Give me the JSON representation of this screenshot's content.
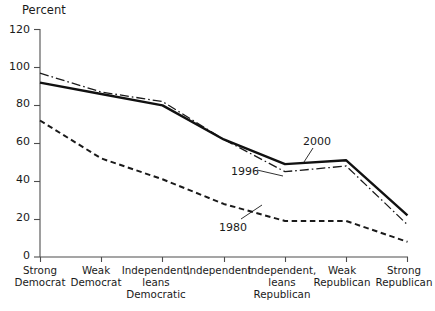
{
  "chart_data": {
    "type": "line",
    "title": "",
    "ylabel": "Percent",
    "xlabel": "",
    "ylim": [
      0,
      120
    ],
    "yticks": [
      0,
      20,
      40,
      60,
      80,
      100,
      120
    ],
    "grid": false,
    "legend_position": "inline-annotations",
    "categories": [
      "Strong\nDemocrat",
      "Weak\nDemocrat",
      "Independent,\nleans\nDemocratic",
      "Independent",
      "Independent,\nleans\nRepublican",
      "Weak\nRepublican",
      "Strong\nRepublican"
    ],
    "series": [
      {
        "name": "1996",
        "style": "dash-dot",
        "color": "#1a1a1a",
        "values": [
          97,
          87,
          82,
          62,
          45,
          48,
          17
        ]
      },
      {
        "name": "2000",
        "style": "solid",
        "color": "#111111",
        "values": [
          92,
          86,
          80,
          62,
          49,
          51,
          22
        ]
      },
      {
        "name": "1980",
        "style": "dashed",
        "color": "#1a1a1a",
        "values": [
          72,
          52,
          41,
          28,
          19,
          19,
          8
        ]
      }
    ],
    "annotations": [
      {
        "text": "2000",
        "series": "2000"
      },
      {
        "text": "1996",
        "series": "1996"
      },
      {
        "text": "1980",
        "series": "1980"
      }
    ]
  },
  "axis": {
    "y_title": "Percent",
    "y_tick_labels": [
      "120",
      "100",
      "80",
      "60",
      "40",
      "20",
      "0"
    ],
    "x_tick_labels": [
      "Strong\nDemocrat",
      "Weak\nDemocrat",
      "Independent,\nleans\nDemocratic",
      "Independent",
      "Independent,\nleans\nRepublican",
      "Weak\nRepublican",
      "Strong\nRepublican"
    ]
  },
  "labels": {
    "a2000": "2000",
    "a1996": "1996",
    "a1980": "1980"
  }
}
